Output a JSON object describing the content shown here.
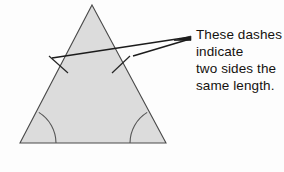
{
  "figure": {
    "background_color": "#fdfdfd",
    "annotation": {
      "lines": [
        "These dashes",
        "indicate",
        "two sides the",
        "same length."
      ]
    },
    "shape": {
      "name": "triangle",
      "fill_color": "#dcdcdc",
      "stroke_color": "#4a4a4a",
      "stroke_width": 1.1,
      "vertices": {
        "apex": {
          "x": 92,
          "y": 5
        },
        "bottom_left": {
          "x": 20,
          "y": 143
        },
        "bottom_right": {
          "x": 166,
          "y": 143
        }
      }
    },
    "tick_marks": [
      {
        "name": "left-side-tick",
        "x1": 49,
        "y1": 56,
        "x2": 68,
        "y2": 73
      },
      {
        "name": "right-side-tick",
        "x1": 112,
        "y1": 73,
        "x2": 130,
        "y2": 56
      }
    ],
    "angle_arcs": [
      {
        "name": "bottom-left-angle-arc",
        "cx": 20,
        "cy": 143,
        "radius": 36
      },
      {
        "name": "bottom-right-angle-arc",
        "cx": 166,
        "cy": 143,
        "radius": 36
      }
    ],
    "leader_lines": [
      {
        "name": "leader-line-long",
        "x1": 52,
        "y1": 58,
        "x2": 190,
        "y2": 37
      },
      {
        "name": "leader-line-short",
        "x1": 133,
        "y1": 56,
        "x2": 190,
        "y2": 39
      }
    ],
    "colors": {
      "ink": "#15120f",
      "line": "#1c1c1c",
      "shape_fill": "#dcdcdc",
      "shape_stroke": "#4a4a4a"
    }
  }
}
